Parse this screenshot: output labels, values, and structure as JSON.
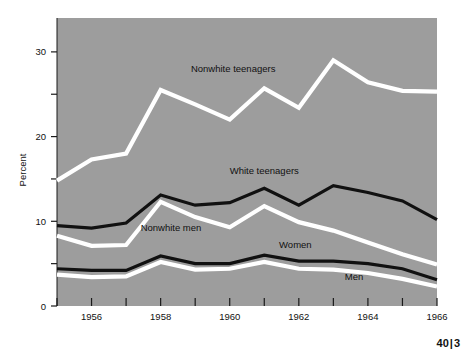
{
  "page_number": {
    "major": "40",
    "separator": "|",
    "minor": "3"
  },
  "colors": {
    "plot_background": "#9d9d9d",
    "page_background": "#ffffff",
    "dark_series": "#111111",
    "light_series": "#ffffff",
    "axis": "#1a1a1a",
    "text": "#111111"
  },
  "chart_data": {
    "type": "line",
    "title": "",
    "subtitle": "",
    "xlabel": "",
    "ylabel": "Percent",
    "xlim": [
      1955,
      1966
    ],
    "ylim": [
      0,
      34
    ],
    "grid": false,
    "legend_position": "inline-annotations",
    "x": [
      1955,
      1956,
      1957,
      1958,
      1959,
      1960,
      1961,
      1962,
      1963,
      1964,
      1965,
      1966
    ],
    "y_ticks_major": [
      0,
      10,
      20,
      30
    ],
    "y_tick_labels": [
      "0",
      "10",
      "20",
      "30"
    ],
    "y_ticks_minor": [
      5,
      15,
      25
    ],
    "x_ticks": [
      1955,
      1956,
      1957,
      1958,
      1959,
      1960,
      1961,
      1962,
      1963,
      1964,
      1965,
      1966
    ],
    "x_tick_labels_shown": [
      "1956",
      "1958",
      "1960",
      "1962",
      "1964",
      "1966"
    ],
    "x_tick_label_years": [
      1956,
      1958,
      1960,
      1962,
      1964,
      1966
    ],
    "series": [
      {
        "name": "Nonwhite teenagers",
        "color": "#ffffff",
        "width": 4.2,
        "label": "Nonwhite teenagers",
        "label_x": 1960.1,
        "label_y": 27.6,
        "label_anchor": "middle",
        "values": [
          14.8,
          17.3,
          18.0,
          25.5,
          23.8,
          22.0,
          25.7,
          23.4,
          29.0,
          26.4,
          25.4,
          25.3
        ]
      },
      {
        "name": "White teenagers",
        "color": "#111111",
        "width": 3.2,
        "label": "White teenagers",
        "label_x": 1961.0,
        "label_y": 15.6,
        "label_anchor": "middle",
        "values": [
          9.5,
          9.2,
          9.8,
          13.1,
          11.9,
          12.2,
          13.9,
          11.9,
          14.2,
          13.4,
          12.4,
          10.2
        ]
      },
      {
        "name": "Nonwhite men",
        "color": "#ffffff",
        "width": 4.2,
        "label": "Nonwhite men",
        "label_x": 1958.3,
        "label_y": 8.9,
        "label_anchor": "middle",
        "values": [
          8.3,
          7.1,
          7.2,
          12.3,
          10.5,
          9.3,
          11.8,
          9.9,
          8.9,
          7.5,
          6.1,
          4.9
        ]
      },
      {
        "name": "Women",
        "color": "#111111",
        "width": 3.2,
        "label": "Women",
        "label_x": 1961.9,
        "label_y": 6.8,
        "label_anchor": "middle",
        "values": [
          4.4,
          4.2,
          4.2,
          5.9,
          5.0,
          5.0,
          6.0,
          5.3,
          5.3,
          5.0,
          4.4,
          3.1
        ]
      },
      {
        "name": "Men",
        "color": "#ffffff",
        "width": 4.2,
        "label": "Men",
        "label_x": 1963.6,
        "label_y": 3.1,
        "label_anchor": "middle",
        "values": [
          3.7,
          3.4,
          3.5,
          5.2,
          4.3,
          4.4,
          5.2,
          4.4,
          4.3,
          3.9,
          3.2,
          2.3
        ]
      }
    ]
  }
}
